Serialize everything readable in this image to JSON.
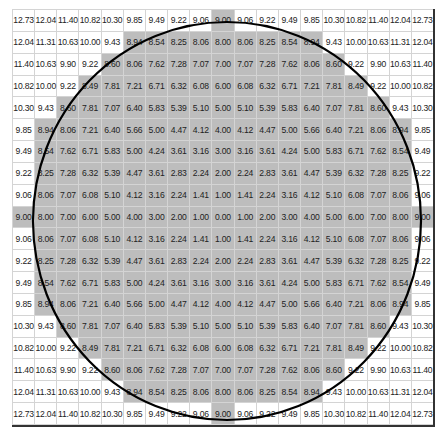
{
  "diagram": {
    "grid_size": 19,
    "threshold": 9.0,
    "colors": {
      "inside_fill": "#bdbdbd",
      "outside_fill": "#ffffff",
      "grid_line": "#d4d4d4",
      "circle_stroke": "#000000",
      "text": "#222222"
    },
    "rows": [
      [
        "12.73",
        "12.04",
        "11.40",
        "10.82",
        "10.30",
        "9.85",
        "9.49",
        "9.22",
        "9.06",
        "9.00",
        "9.06",
        "9.22",
        "9.49",
        "9.85",
        "10.30",
        "10.82",
        "11.40",
        "12.04",
        "12.73"
      ],
      [
        "12.04",
        "11.31",
        "10.63",
        "10.00",
        "9.43",
        "8.94",
        "8.54",
        "8.25",
        "8.06",
        "8.00",
        "8.06",
        "8.25",
        "8.54",
        "8.94",
        "9.43",
        "10.00",
        "10.63",
        "11.31",
        "12.04"
      ],
      [
        "11.40",
        "10.63",
        "9.90",
        "9.22",
        "8.60",
        "8.06",
        "7.62",
        "7.28",
        "7.07",
        "7.00",
        "7.07",
        "7.28",
        "7.62",
        "8.06",
        "8.60",
        "9.22",
        "9.90",
        "10.63",
        "11.40"
      ],
      [
        "10.82",
        "10.00",
        "9.22",
        "8.49",
        "7.81",
        "7.21",
        "6.71",
        "6.32",
        "6.08",
        "6.00",
        "6.08",
        "6.32",
        "6.71",
        "7.21",
        "7.81",
        "8.49",
        "9.22",
        "10.00",
        "10.82"
      ],
      [
        "10.30",
        "9.43",
        "8.60",
        "7.81",
        "7.07",
        "6.40",
        "5.83",
        "5.39",
        "5.10",
        "5.00",
        "5.10",
        "5.39",
        "5.83",
        "6.40",
        "7.07",
        "7.81",
        "8.60",
        "9.43",
        "10.30"
      ],
      [
        "9.85",
        "8.94",
        "8.06",
        "7.21",
        "6.40",
        "5.66",
        "5.00",
        "4.47",
        "4.12",
        "4.00",
        "4.12",
        "4.47",
        "5.00",
        "5.66",
        "6.40",
        "7.21",
        "8.06",
        "8.94",
        "9.85"
      ],
      [
        "9.49",
        "8.54",
        "7.62",
        "6.71",
        "5.83",
        "5.00",
        "4.24",
        "3.61",
        "3.16",
        "3.00",
        "3.16",
        "3.61",
        "4.24",
        "5.00",
        "5.83",
        "6.71",
        "7.62",
        "8.54",
        "9.49"
      ],
      [
        "9.22",
        "8.25",
        "7.28",
        "6.32",
        "5.39",
        "4.47",
        "3.61",
        "2.83",
        "2.24",
        "2.00",
        "2.24",
        "2.83",
        "3.61",
        "4.47",
        "5.39",
        "6.32",
        "7.28",
        "8.25",
        "9.22"
      ],
      [
        "9.06",
        "8.06",
        "7.07",
        "6.08",
        "5.10",
        "4.12",
        "3.16",
        "2.24",
        "1.41",
        "1.00",
        "1.41",
        "2.24",
        "3.16",
        "4.12",
        "5.10",
        "6.08",
        "7.07",
        "8.06",
        "9.06"
      ],
      [
        "9.00",
        "8.00",
        "7.00",
        "6.00",
        "5.00",
        "4.00",
        "3.00",
        "2.00",
        "1.00",
        "0.00",
        "1.00",
        "2.00",
        "3.00",
        "4.00",
        "5.00",
        "6.00",
        "7.00",
        "8.00",
        "9.00"
      ],
      [
        "9.06",
        "8.06",
        "7.07",
        "6.08",
        "5.10",
        "4.12",
        "3.16",
        "2.24",
        "1.41",
        "1.00",
        "1.41",
        "2.24",
        "3.16",
        "4.12",
        "5.10",
        "6.08",
        "7.07",
        "8.06",
        "9.06"
      ],
      [
        "9.22",
        "8.25",
        "7.28",
        "6.32",
        "5.39",
        "4.47",
        "3.61",
        "2.83",
        "2.24",
        "2.00",
        "2.24",
        "2.83",
        "3.61",
        "4.47",
        "5.39",
        "6.32",
        "7.28",
        "8.25",
        "9.22"
      ],
      [
        "9.49",
        "8.54",
        "7.62",
        "6.71",
        "5.83",
        "5.00",
        "4.24",
        "3.61",
        "3.16",
        "3.00",
        "3.16",
        "3.61",
        "4.24",
        "5.00",
        "5.83",
        "6.71",
        "7.62",
        "8.54",
        "9.49"
      ],
      [
        "9.85",
        "8.94",
        "8.06",
        "7.21",
        "6.40",
        "5.66",
        "5.00",
        "4.47",
        "4.12",
        "4.00",
        "4.12",
        "4.47",
        "5.00",
        "5.66",
        "6.40",
        "7.21",
        "8.06",
        "8.94",
        "9.85"
      ],
      [
        "10.30",
        "9.43",
        "8.60",
        "7.81",
        "7.07",
        "6.40",
        "5.83",
        "5.39",
        "5.10",
        "5.00",
        "5.10",
        "5.39",
        "5.83",
        "6.40",
        "7.07",
        "7.81",
        "8.60",
        "9.43",
        "10.30"
      ],
      [
        "10.82",
        "10.00",
        "9.22",
        "8.49",
        "7.81",
        "7.21",
        "6.71",
        "6.32",
        "6.08",
        "6.00",
        "6.08",
        "6.32",
        "6.71",
        "7.21",
        "7.81",
        "8.49",
        "9.22",
        "10.00",
        "10.82"
      ],
      [
        "11.40",
        "10.63",
        "9.90",
        "9.22",
        "8.60",
        "8.06",
        "7.62",
        "7.28",
        "7.07",
        "7.00",
        "7.07",
        "7.28",
        "7.62",
        "8.06",
        "8.60",
        "9.22",
        "9.90",
        "10.63",
        "11.40"
      ],
      [
        "12.04",
        "11.31",
        "10.63",
        "10.00",
        "9.43",
        "8.94",
        "8.54",
        "8.25",
        "8.06",
        "8.00",
        "8.06",
        "8.25",
        "8.54",
        "8.94",
        "9.43",
        "10.00",
        "10.63",
        "11.31",
        "12.04"
      ],
      [
        "12.73",
        "12.04",
        "11.40",
        "10.82",
        "10.30",
        "9.85",
        "9.49",
        "9.22",
        "9.06",
        "9.00",
        "9.06",
        "9.22",
        "9.49",
        "9.85",
        "10.30",
        "10.82",
        "11.40",
        "12.04",
        "12.73"
      ]
    ],
    "circle": {
      "cx": 227,
      "cy": 221,
      "rx": 194,
      "ry": 199
    }
  }
}
